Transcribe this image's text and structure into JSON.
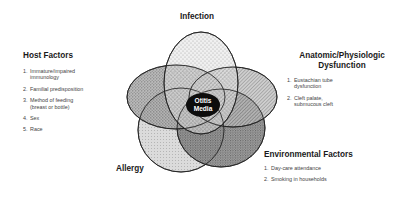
{
  "diagram": {
    "center_label": [
      "Otitis",
      "Media"
    ],
    "sets": [
      {
        "id": "infection",
        "label": "Infection",
        "pattern": "sparse-dots",
        "fill": "#d6d6d6"
      },
      {
        "id": "host",
        "label": "Host Factors",
        "pattern": "medium-stipple",
        "fill": "#9a9a9a"
      },
      {
        "id": "anatomic",
        "label": "Anatomic/Physiologic Dysfunction",
        "pattern": "diagonal-hatch",
        "fill": "#a8a8a8"
      },
      {
        "id": "allergy",
        "label": "Allergy",
        "pattern": "fine-stipple",
        "fill": "#c8c8c8"
      },
      {
        "id": "environmental",
        "label": "Environmental Factors",
        "pattern": "dense-stipple",
        "fill": "#8a8a8a"
      }
    ]
  },
  "labels": {
    "infection": "Infection",
    "allergy": "Allergy",
    "host": {
      "title": "Host Factors",
      "items": [
        {
          "num": "1.",
          "line1": "Immature/impaired",
          "line2": "immunology"
        },
        {
          "num": "2.",
          "line1": "Familial predisposition",
          "line2": ""
        },
        {
          "num": "3.",
          "line1": "Method of feeding",
          "line2": "(breast or bottle)"
        },
        {
          "num": "4.",
          "line1": "Sex",
          "line2": ""
        },
        {
          "num": "5.",
          "line1": "Race",
          "line2": ""
        }
      ]
    },
    "anatomic": {
      "title_line1": "Anatomic/Physiologic",
      "title_line2": "Dysfunction",
      "items": [
        {
          "num": "1.",
          "line1": "Eustachian tube",
          "line2": "dysfunction"
        },
        {
          "num": "2.",
          "line1": "Cleft palate,",
          "line2": "submucous cleft"
        }
      ]
    },
    "environmental": {
      "title": "Environmental Factors",
      "items": [
        {
          "num": "1.",
          "line1": "Day-care attendance",
          "line2": ""
        },
        {
          "num": "2.",
          "line1": "Smoking in households",
          "line2": ""
        }
      ]
    }
  }
}
